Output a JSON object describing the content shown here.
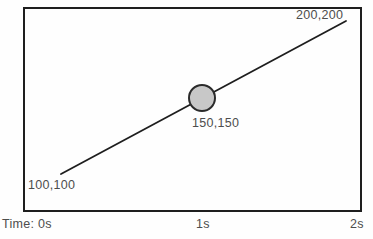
{
  "diagram": {
    "points": [
      {
        "label": "100,100",
        "time": "0s"
      },
      {
        "label": "150,150",
        "time": "1s"
      },
      {
        "label": "200,200",
        "time": "2s"
      }
    ],
    "time_axis": {
      "start": "Time: 0s",
      "mid": "1s",
      "end": "2s"
    },
    "colors": {
      "background": "#fefefe",
      "frame_border": "#1e1e1e",
      "path_line": "#1e1e1e",
      "circle_fill": "#c8c8c8",
      "circle_stroke": "#2b2b2b",
      "label_text": "#4d4d4d"
    }
  }
}
